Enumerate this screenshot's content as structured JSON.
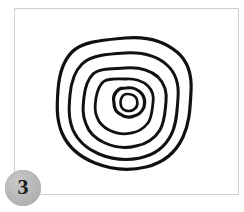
{
  "panel": {
    "background_color": "#ffffff",
    "border_color": "#cfcfcf",
    "x": 14,
    "y": 8,
    "width": 225,
    "height": 187
  },
  "badge": {
    "label": "3",
    "fill_color": "#b2b2b2",
    "text_color": "#1a1a1a",
    "diameter": 36
  },
  "figure": {
    "title": "",
    "caption": "",
    "type": "hand-drawn-concentric-rings",
    "stroke_color": "#111111",
    "fill_color": "#ffffff",
    "stroke_width": 3,
    "ring_count": 5,
    "center": {
      "x": 125,
      "y": 103
    },
    "bounds": {
      "x_min": 57,
      "x_max": 192,
      "y_min": 37,
      "y_max": 169
    },
    "rings": [
      {
        "name": "ring-1-outer",
        "stroke_width": 3.2,
        "path": "M 125 38 C 146 36 164 41 177 52 C 189 62 192 77 191 92 C 190 107 190 122 183 137 C 176 152 163 163 146 167 C 129 171 110 169 95 163 C 80 157 68 147 62 133 C 56 119 57 104 58 90 C 59 76 62 62 72 52 C 83 41 104 40 125 38 Z"
      },
      {
        "name": "ring-2",
        "stroke_width": 3.0,
        "path": "M 125 53 C 142 52 157 56 167 65 C 177 74 179 86 178 98 C 177 110 177 124 171 135 C 165 147 154 155 140 158 C 126 161 111 159 99 154 C 87 149 78 141 73 130 C 68 118 69 106 70 95 C 71 83 74 72 82 64 C 91 55 108 54 125 53 Z"
      },
      {
        "name": "ring-3",
        "stroke_width": 3.0,
        "path": "M 125 68 C 138 67 150 70 158 77 C 165 84 167 93 166 102 C 165 111 165 121 160 130 C 155 138 147 144 136 146 C 125 149 114 147 105 143 C 96 139 89 133 86 124 C 82 115 83 106 84 97 C 85 88 87 80 93 74 C 100 68 112 69 125 68 Z"
      },
      {
        "name": "ring-4",
        "stroke_width": 2.8,
        "path": "M 125 79 C 134 78 143 81 148 86 C 153 91 154 97 153 103 C 152 110 152 117 148 123 C 144 128 138 132 131 133 C 123 135 115 133 109 130 C 103 127 99 123 97 117 C 94 111 95 104 96 98 C 97 92 99 86 103 82 C 108 78 116 79 125 79 Z"
      },
      {
        "name": "ring-5-inner-core",
        "stroke_width": 3.2,
        "path": "M 126 88 C 133 87 139 90 142 94 C 145 98 145 103 144 107 C 142 112 139 115 134 116 C 129 118 124 117 120 114 C 116 112 114 108 114 103 C 113 99 114 94 117 91 C 120 88 122 88 126 88 Z"
      },
      {
        "name": "ring-6-inner-blob",
        "stroke_width": 2.6,
        "path": "M 127 94 C 132 94 136 96 137 100 C 138 104 137 108 133 110 C 129 112 124 111 122 108 C 120 105 120 100 122 97 C 123 95 125 94 127 94 Z"
      }
    ]
  }
}
